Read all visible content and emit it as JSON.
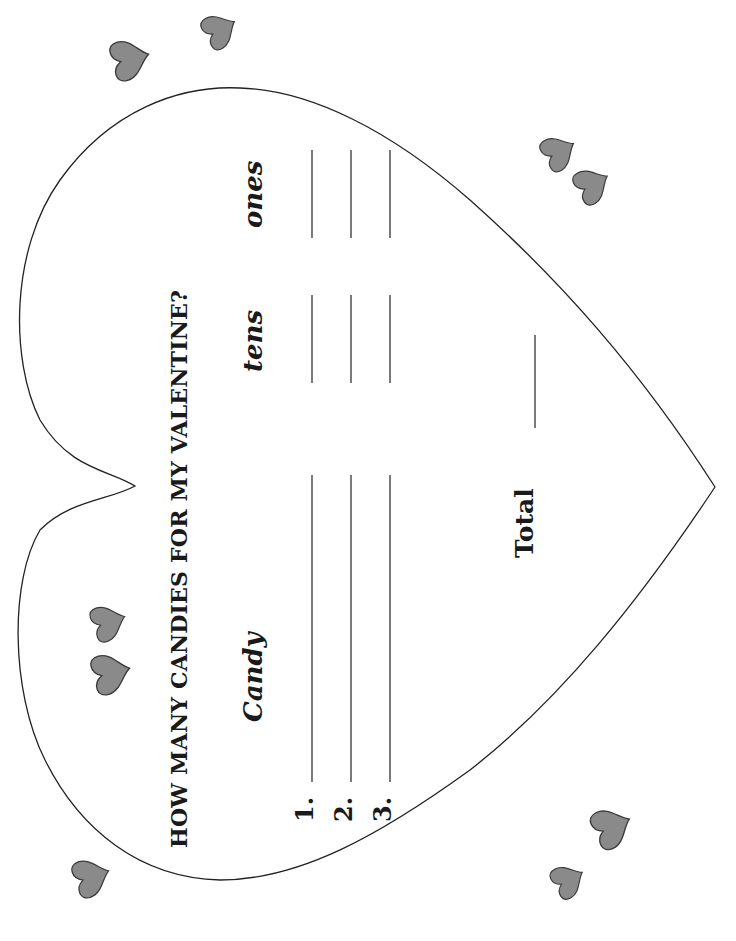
{
  "worksheet": {
    "title": "HOW MANY CANDIES FOR MY VALENTINE?",
    "columns": {
      "candy": "Candy",
      "tens": "tens",
      "ones": "ones"
    },
    "rows": [
      {
        "number": "1.",
        "candy": "",
        "tens": "",
        "ones": ""
      },
      {
        "number": "2.",
        "candy": "",
        "tens": "",
        "ones": ""
      },
      {
        "number": "3.",
        "candy": "",
        "tens": "",
        "ones": ""
      }
    ],
    "total_label": "Total",
    "total_value": ""
  },
  "decorations": {
    "heart_fill": "#8a8a8a",
    "heart_stroke": "#3a3a3a",
    "outline_color": "#222222",
    "small_hearts_count": 10
  }
}
